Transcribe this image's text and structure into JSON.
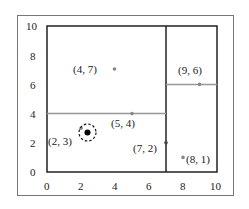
{
  "diagram": {
    "title": "",
    "type": "kd-tree-partition",
    "axis": {
      "xrange": [
        0,
        10
      ],
      "yrange": [
        0,
        10
      ],
      "x_ticks": [
        "0",
        "2",
        "4",
        "6",
        "8",
        "10"
      ],
      "y_ticks": [
        "0",
        "2",
        "4",
        "6",
        "8",
        "10"
      ]
    },
    "splits": [
      {
        "orientation": "vertical",
        "at": 7,
        "from": 0,
        "to": 10,
        "color": "#222222"
      },
      {
        "orientation": "horizontal",
        "at": 4,
        "from": 0,
        "to": 7,
        "color": "#999999"
      },
      {
        "orientation": "horizontal",
        "at": 6,
        "from": 7,
        "to": 10,
        "color": "#999999"
      }
    ],
    "points": [
      {
        "x": 2,
        "y": 3,
        "label": "(2, 3)"
      },
      {
        "x": 5,
        "y": 4,
        "label": "(5, 4)"
      },
      {
        "x": 4,
        "y": 7,
        "label": "(4, 7)"
      },
      {
        "x": 7,
        "y": 2,
        "label": "(7, 2)"
      },
      {
        "x": 8,
        "y": 1,
        "label": "(8, 1)"
      },
      {
        "x": 9,
        "y": 6,
        "label": "(9, 6)"
      }
    ],
    "query_point": {
      "x": 2.4,
      "y": 2.8,
      "style": "dot with dashed circle"
    }
  }
}
